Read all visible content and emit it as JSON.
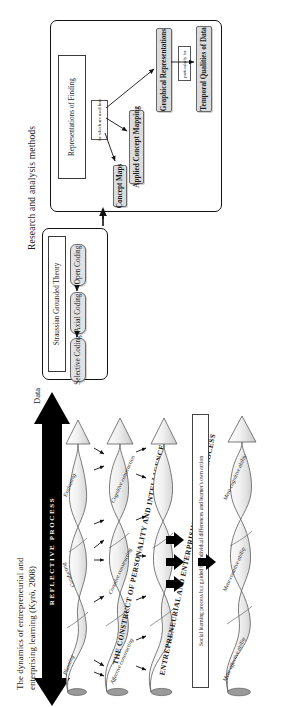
{
  "figure": {
    "orientation": "rotated-90-ccw",
    "top_section": {
      "heading": "Research and analysis methods",
      "data_label": "Data",
      "grounded_theory_panel": {
        "title": "Straussian Grounded Theory",
        "steps": [
          "Open Coding",
          "Axial Coding",
          "Selective Coding"
        ]
      },
      "representations_panel": {
        "title": "Representations of Finding",
        "connector_note": "for which are used here",
        "nodes": [
          "Concept Maps",
          "Applied Concept Mapping",
          "Graphical Representations",
          "Temporal Qualities of Data"
        ],
        "edge_note": "particularly for"
      }
    },
    "bottom_section": {
      "caption_line1": "The dynamics of entrepreneurial and",
      "caption_line2": "enterprising learning (Kyrö, 2008)",
      "reflective_band": "REFLECTIVE PROCESS",
      "social_note": "Social learning process but guided by individual differences and learner's own action",
      "ribbons": [
        {
          "name": "process-ribbon",
          "title": "",
          "stages": [
            "Planning",
            "Conducting",
            "Evaluating"
          ]
        },
        {
          "name": "construct-ribbon",
          "title": "THE CONSTRUCT OF PERSONALITY AND INTELLIGENCE",
          "stages": [
            "Affective constructing",
            "Conative constructing",
            "Cognitive construction"
          ]
        },
        {
          "name": "learning-ribbon",
          "title": "ENTREPRENEURIAL AND ENTERPRISING LEARNING PROCESS",
          "stages": []
        },
        {
          "name": "meta-ribbon",
          "title": "",
          "stages": [
            "Meta-affective ability",
            "Meta-conative ability",
            "Meta-cognitive ability"
          ]
        }
      ]
    },
    "colors": {
      "panel_border": "#111111",
      "node_fill": "#dcdcdc",
      "band_fill": "#000000",
      "ribbon_fill": "#e8e8e8",
      "text": "#1a1a1a"
    }
  }
}
